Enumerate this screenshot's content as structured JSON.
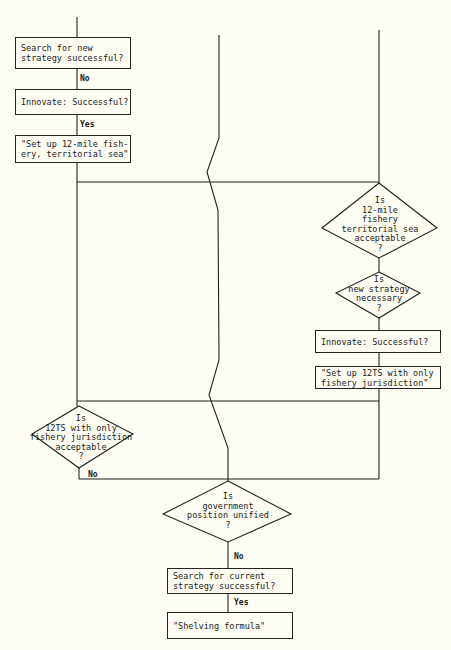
{
  "diagram": {
    "type": "flowchart",
    "colors": {
      "background": "#fdfdf3",
      "line": "#222222",
      "text": "#1a1a1a"
    },
    "left_column": {
      "boxes": [
        {
          "id": "b1",
          "text": "Search for new\nstrategy successful?"
        },
        {
          "id": "b2",
          "text": "Innovate: Successful?"
        },
        {
          "id": "b3",
          "text": "\"Set up 12-mile fish-\nery, territorial sea\""
        }
      ],
      "edge_labels": [
        "No",
        "Yes"
      ],
      "decision": {
        "id": "d3",
        "text": "Is\n12TS with only\nfishery jurisdiction\nacceptable\n?",
        "exit_label": "No"
      }
    },
    "right_column": {
      "decisions": [
        {
          "id": "d1",
          "text": "Is\n12-mile\nfishery\nterritorial sea\nacceptable\n?"
        },
        {
          "id": "d2",
          "text": "Is\nnew strategy\nnecessary\n?"
        }
      ],
      "boxes": [
        {
          "id": "b4",
          "text": "Innovate: Successful?"
        },
        {
          "id": "b5",
          "text": "\"Set up 12TS with only\nfishery jurisdiction\""
        }
      ]
    },
    "bottom": {
      "decision": {
        "id": "d4",
        "text": "Is\ngovernment\nposition unified\n?"
      },
      "edge_labels": [
        "No",
        "Yes"
      ],
      "boxes": [
        {
          "id": "b6",
          "text": "Search for current\nstrategy successful?"
        },
        {
          "id": "b7",
          "text": "\"Shelving formula\""
        }
      ]
    }
  }
}
